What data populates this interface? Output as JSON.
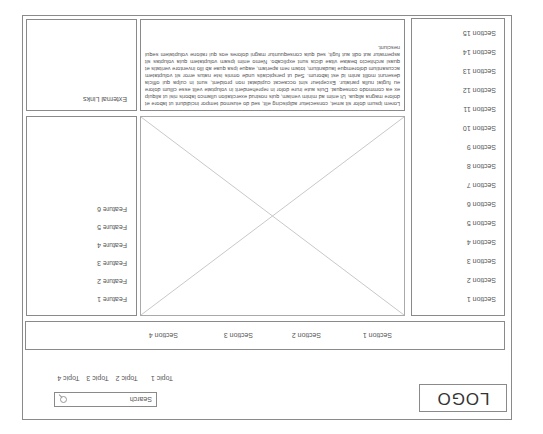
{
  "header": {
    "logo": "LOGO",
    "topics": [
      "Topic 1",
      "Topic 2",
      "Topic 3",
      "Topic 4"
    ],
    "search_placeholder": "Search",
    "search_icon": "search-icon"
  },
  "section_bar": {
    "tabs": [
      "Section 1",
      "Section 2",
      "Section 3",
      "Section 4"
    ]
  },
  "sidebar": {
    "items": [
      "Section 1",
      "Section 2",
      "Section 3",
      "Section 4",
      "Section 5",
      "Section 6",
      "Section 7",
      "Section 8",
      "Section 9",
      "Section 10",
      "Section 11",
      "Section 12",
      "Section 13",
      "Section 14",
      "Section 15"
    ]
  },
  "main": {
    "image_placeholder": "image-placeholder",
    "text": "Lorem ipsum dolor sit amet, consectetur adipiscing elit, sed do eiusmod tempor incididunt ut labore et dolore magna aliqua. Ut enim ad minim veniam, quis nostrud exercitation ullamco laboris nisi ut aliquip ex ea commodo consequat. Duis aute irure dolor in reprehenderit in voluptate velit esse cillum dolore eu fugiat nulla pariatur. Excepteur sint occaecat cupidatat non proident, sunt in culpa qui officia deserunt mollit anim id est laborum. Sed ut perspiciatis unde omnis iste natus error sit voluptatem accusantium doloremque laudantium, totam rem aperiam, eaque ipsa quae ab illo inventore veritatis et quasi architecto beatae vitae dicta sunt explicabo. Nemo enim ipsam voluptatem quia voluptas sit aspernatur aut odit aut fugit, sed quia consequuntur magni dolores eos qui ratione voluptatem sequi nesciunt."
  },
  "features": {
    "items": [
      "Feature 1",
      "Feature 2",
      "Feature 3",
      "Feature 4",
      "Feature 5",
      "Feature 6"
    ]
  },
  "external_links": {
    "label": "External Links"
  }
}
